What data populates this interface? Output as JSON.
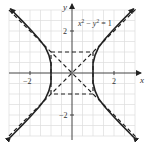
{
  "diagram": {
    "equation_label": {
      "lhs_x": "x",
      "exp": "2",
      "minus": " − ",
      "lhs_y": "y",
      "exp2": "2",
      "rhs": " = 1"
    },
    "axes": {
      "x_label": "x",
      "y_label": "y"
    },
    "ticks": {
      "x": [
        {
          "value": -2,
          "label": "−2"
        },
        {
          "value": 2,
          "label": "2"
        }
      ],
      "y": [
        {
          "value": 2,
          "label": "2"
        },
        {
          "value": -2,
          "label": "−2"
        }
      ]
    },
    "range": {
      "x": [
        -3,
        3
      ],
      "y": [
        -3,
        3
      ]
    },
    "grid_step": 0.5,
    "curve": {
      "type": "hyperbola",
      "a": 1,
      "b": 1,
      "style": "solid"
    },
    "asymptotes": [
      "y = x",
      "y = -x"
    ],
    "fundamental_rectangle": {
      "x": [
        -1,
        1
      ],
      "y": [
        -1,
        1
      ],
      "style": "dashed"
    },
    "colors": {
      "curve": "#222222",
      "grid": "#dcdcdc",
      "axes": "#444444"
    }
  }
}
